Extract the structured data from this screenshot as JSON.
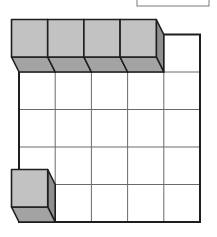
{
  "diagram": {
    "grid": {
      "rows": 4,
      "cols": 5
    },
    "open_cells": [
      {
        "row": -1,
        "col": 4
      }
    ],
    "cubes": [
      {
        "row": -1,
        "col": 0
      },
      {
        "row": -1,
        "col": 1
      },
      {
        "row": -1,
        "col": 2
      },
      {
        "row": -1,
        "col": 3
      },
      {
        "row": 3,
        "col": 0
      }
    ],
    "answer_box_text": "",
    "colors": {
      "cube_front": "#c2c2c2",
      "cube_bottom": "#a3a3a3",
      "cube_side": "#8f8f8f",
      "outline": "#1e1e1e",
      "grid_line": "#6a6a6a"
    }
  }
}
